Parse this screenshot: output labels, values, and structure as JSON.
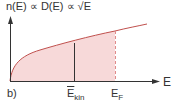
{
  "diagram": {
    "title": "n(E) ∝ D(E) ∝ √E",
    "panel_label": "b)",
    "x_axis_label": "E",
    "marker_mean": {
      "base": "E",
      "sub": "kin",
      "overbar": true
    },
    "marker_fermi": {
      "base": "E",
      "sub": "F"
    },
    "colors": {
      "curve": "#c0504d",
      "fill": "#f6d6d6",
      "axis": "#333333",
      "mean_line": "#333333",
      "fermi_line": "#e08a8a"
    }
  }
}
